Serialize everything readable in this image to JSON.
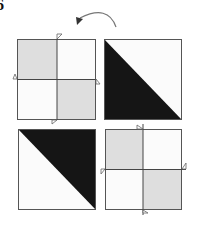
{
  "figure": {
    "label": "6",
    "rotation_arrow": {
      "direction": "counterclockwise",
      "icon": "curved-arrow-icon"
    },
    "colors": {
      "border": "#555555",
      "light_gray": "#dedede",
      "white": "#fbfbfb",
      "black": "#151515"
    },
    "tiles": [
      {
        "position": "top-left",
        "type": "quartered",
        "shaded_quadrants": [
          "top-left",
          "bottom-right"
        ],
        "x": 17,
        "y": 39,
        "w": 79,
        "h": 81,
        "cx": 57,
        "cy": 79
      },
      {
        "position": "top-right",
        "type": "half-diagonal",
        "black_half": "lower-left",
        "x": 104,
        "y": 39,
        "w": 78,
        "h": 81
      },
      {
        "position": "bottom-left",
        "type": "half-diagonal",
        "black_half": "upper-right",
        "x": 18,
        "y": 129,
        "w": 78,
        "h": 81
      },
      {
        "position": "bottom-right",
        "type": "quartered",
        "shaded_quadrants": [
          "top-left",
          "bottom-right"
        ],
        "x": 105,
        "y": 129,
        "w": 77,
        "h": 81,
        "cx": 143,
        "cy": 169
      }
    ]
  }
}
